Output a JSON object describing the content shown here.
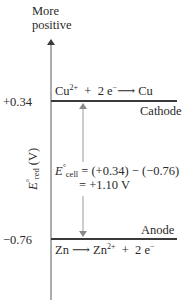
{
  "top_label": {
    "line1": "More",
    "line2": "positive"
  },
  "y_axis": {
    "symbol": "E",
    "degree": "°",
    "subscript": "red",
    "unit": "(V)"
  },
  "levels": [
    {
      "value": "+0.34",
      "equation": {
        "species1": "Cu",
        "charge1": "2+",
        "plus": "+",
        "electrons": "2 e",
        "e_charge": "−",
        "arrow": "⟶",
        "product": "Cu"
      },
      "role": "Cathode"
    },
    {
      "value": "−0.76",
      "equation": {
        "species1": "Zn",
        "arrow": "⟶",
        "product": "Zn",
        "product_charge": "2+",
        "plus": "+",
        "electrons": "2 e",
        "e_charge": "−"
      },
      "role": "Anode"
    }
  ],
  "ecell": {
    "symbol": "E",
    "degree": "°",
    "subscript": "cell",
    "line1": "= (+0.34) − (−0.76)",
    "line2": "= +1.10 V"
  },
  "colors": {
    "axis": "#5a5a5a",
    "level_line": "#3a3a3a",
    "arrow": "#9a9a9a",
    "text": "#2a2a2a"
  }
}
